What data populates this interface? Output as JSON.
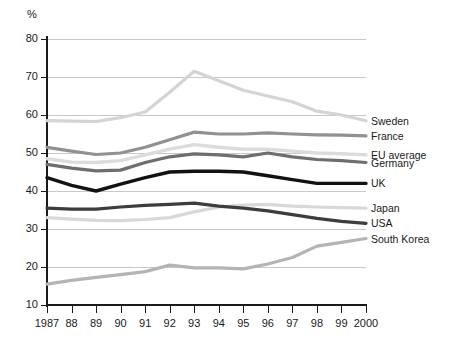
{
  "axis": {
    "unit_label": "%",
    "y_ticks": [
      "80",
      "70",
      "60",
      "50",
      "40",
      "30",
      "20",
      "10"
    ],
    "x_ticks": [
      "1987",
      "88",
      "89",
      "90",
      "91",
      "92",
      "93",
      "94",
      "95",
      "96",
      "97",
      "98",
      "99",
      "2000"
    ]
  },
  "legend": [
    {
      "label": "Sweden",
      "color": "#d4d4d4"
    },
    {
      "label": "France",
      "color": "#919191"
    },
    {
      "label": "EU average",
      "color": "#dcdcdc"
    },
    {
      "label": "Germany",
      "color": "#6e6e6e"
    },
    {
      "label": "UK",
      "color": "#121212"
    },
    {
      "label": "Japan",
      "color": "#d8d8d8"
    },
    {
      "label": "USA",
      "color": "#3d3d3d"
    },
    {
      "label": "South Korea",
      "color": "#b4b4b4"
    }
  ],
  "chart_data": {
    "type": "line",
    "title": "",
    "subtitle": "",
    "xlabel": "",
    "ylabel": "%",
    "grid": true,
    "legend_position": "right-inline",
    "xlim": [
      1987,
      2000
    ],
    "ylim": [
      10,
      80
    ],
    "y_tick_step": 10,
    "x": [
      1987,
      1988,
      1989,
      1990,
      1991,
      1992,
      1993,
      1994,
      1995,
      1996,
      1997,
      1998,
      1999,
      2000
    ],
    "series": [
      {
        "name": "Sweden",
        "color": "#d4d4d4",
        "values": [
          58.5,
          58.4,
          58.3,
          59.3,
          60.8,
          66.0,
          71.5,
          69.0,
          66.5,
          65.0,
          63.5,
          61.0,
          60.0,
          58.5
        ]
      },
      {
        "name": "France",
        "color": "#919191",
        "values": [
          51.5,
          50.5,
          49.6,
          50.0,
          51.5,
          53.5,
          55.5,
          55.0,
          55.0,
          55.3,
          55.0,
          54.8,
          54.7,
          54.5
        ]
      },
      {
        "name": "EU average",
        "color": "#dcdcdc",
        "values": [
          48.5,
          47.6,
          47.5,
          48.0,
          49.5,
          51.0,
          52.2,
          51.5,
          51.0,
          51.0,
          50.5,
          50.0,
          49.8,
          49.5
        ]
      },
      {
        "name": "Germany",
        "color": "#6e6e6e",
        "values": [
          47.0,
          46.0,
          45.3,
          45.5,
          47.5,
          49.0,
          49.8,
          49.5,
          49.0,
          50.0,
          49.0,
          48.3,
          48.0,
          47.5
        ]
      },
      {
        "name": "UK",
        "color": "#121212",
        "values": [
          43.5,
          41.5,
          40.0,
          41.8,
          43.5,
          45.0,
          45.2,
          45.2,
          45.0,
          44.0,
          43.0,
          42.0,
          42.0,
          42.0
        ]
      },
      {
        "name": "Japan",
        "color": "#d8d8d8",
        "values": [
          33.0,
          32.6,
          32.3,
          32.2,
          32.5,
          33.0,
          34.5,
          35.8,
          36.3,
          36.5,
          36.0,
          35.8,
          35.6,
          35.5
        ]
      },
      {
        "name": "USA",
        "color": "#3d3d3d",
        "values": [
          35.5,
          35.2,
          35.2,
          35.8,
          36.2,
          36.5,
          36.8,
          36.0,
          35.5,
          34.8,
          33.8,
          32.8,
          32.0,
          31.5
        ]
      },
      {
        "name": "South Korea",
        "color": "#b4b4b4",
        "values": [
          15.5,
          16.5,
          17.3,
          18.0,
          18.8,
          20.5,
          19.8,
          19.8,
          19.5,
          20.8,
          22.5,
          25.5,
          26.5,
          27.5
        ]
      }
    ]
  },
  "legend_anchor_values": {
    "Sweden": 58.5,
    "France": 54.5,
    "EU average": 49.5,
    "Germany": 47.5,
    "UK": 42.0,
    "Japan": 35.5,
    "USA": 31.5,
    "South Korea": 27.5
  }
}
